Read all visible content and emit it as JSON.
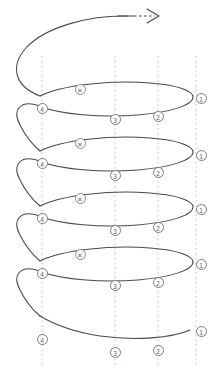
{
  "figure": {
    "type": "line-diagram",
    "background_color": "#ffffff",
    "curve_color": "#4a4a4a",
    "guide_color": "#b9b9b9",
    "marker_stroke_color": "#7a7a7a",
    "marker_text_color": "#5e5e5e",
    "width": 215,
    "height": 373
  },
  "direction_arrow": {
    "name": "winding-direction-arrow",
    "solid_label": "",
    "dashed_label": "",
    "head_label": ""
  },
  "guides": [
    {
      "id": "guide-4",
      "label": "4",
      "x": 42
    },
    {
      "id": "guide-3",
      "label": "3",
      "x": 115
    },
    {
      "id": "guide-2",
      "label": "2",
      "x": 158
    },
    {
      "id": "guide-1",
      "label": "1",
      "x": 196
    }
  ],
  "markers": [
    {
      "id": "m-x-1",
      "label": "✕",
      "kind": "cross",
      "x": 80,
      "y": 89
    },
    {
      "id": "m-1-1",
      "label": "1",
      "kind": "number",
      "x": 201,
      "y": 98
    },
    {
      "id": "m-4-1",
      "label": "4",
      "kind": "number",
      "x": 42,
      "y": 108
    },
    {
      "id": "m-3-1",
      "label": "3",
      "kind": "number",
      "x": 115,
      "y": 119
    },
    {
      "id": "m-2-1",
      "label": "2",
      "kind": "number",
      "x": 158,
      "y": 116
    },
    {
      "id": "m-x-2",
      "label": "✕",
      "kind": "cross",
      "x": 80,
      "y": 143
    },
    {
      "id": "m-1-2",
      "label": "1",
      "kind": "number",
      "x": 201,
      "y": 155
    },
    {
      "id": "m-4-2",
      "label": "4",
      "kind": "number",
      "x": 42,
      "y": 163
    },
    {
      "id": "m-3-2",
      "label": "3",
      "kind": "number",
      "x": 115,
      "y": 175
    },
    {
      "id": "m-2-2",
      "label": "2",
      "kind": "number",
      "x": 158,
      "y": 172
    },
    {
      "id": "m-x-3",
      "label": "✕",
      "kind": "cross",
      "x": 80,
      "y": 198
    },
    {
      "id": "m-1-3",
      "label": "1",
      "kind": "number",
      "x": 201,
      "y": 209
    },
    {
      "id": "m-4-3",
      "label": "4",
      "kind": "number",
      "x": 42,
      "y": 218
    },
    {
      "id": "m-3-3",
      "label": "3",
      "kind": "number",
      "x": 115,
      "y": 230
    },
    {
      "id": "m-2-3",
      "label": "2",
      "kind": "number",
      "x": 158,
      "y": 227
    },
    {
      "id": "m-x-4",
      "label": "✕",
      "kind": "cross",
      "x": 80,
      "y": 254
    },
    {
      "id": "m-1-4",
      "label": "1",
      "kind": "number",
      "x": 201,
      "y": 264
    },
    {
      "id": "m-4-4",
      "label": "4",
      "kind": "number",
      "x": 42,
      "y": 273
    },
    {
      "id": "m-3-4",
      "label": "3",
      "kind": "number",
      "x": 115,
      "y": 285
    },
    {
      "id": "m-2-4",
      "label": "2",
      "kind": "number",
      "x": 158,
      "y": 282
    },
    {
      "id": "m-1-5",
      "label": "1",
      "kind": "number",
      "x": 201,
      "y": 331
    },
    {
      "id": "m-4-5",
      "label": "4",
      "kind": "number",
      "x": 42,
      "y": 339
    },
    {
      "id": "m-3-5",
      "label": "3",
      "kind": "number",
      "x": 115,
      "y": 352
    },
    {
      "id": "m-2-5",
      "label": "2",
      "kind": "number",
      "x": 158,
      "y": 350
    }
  ]
}
